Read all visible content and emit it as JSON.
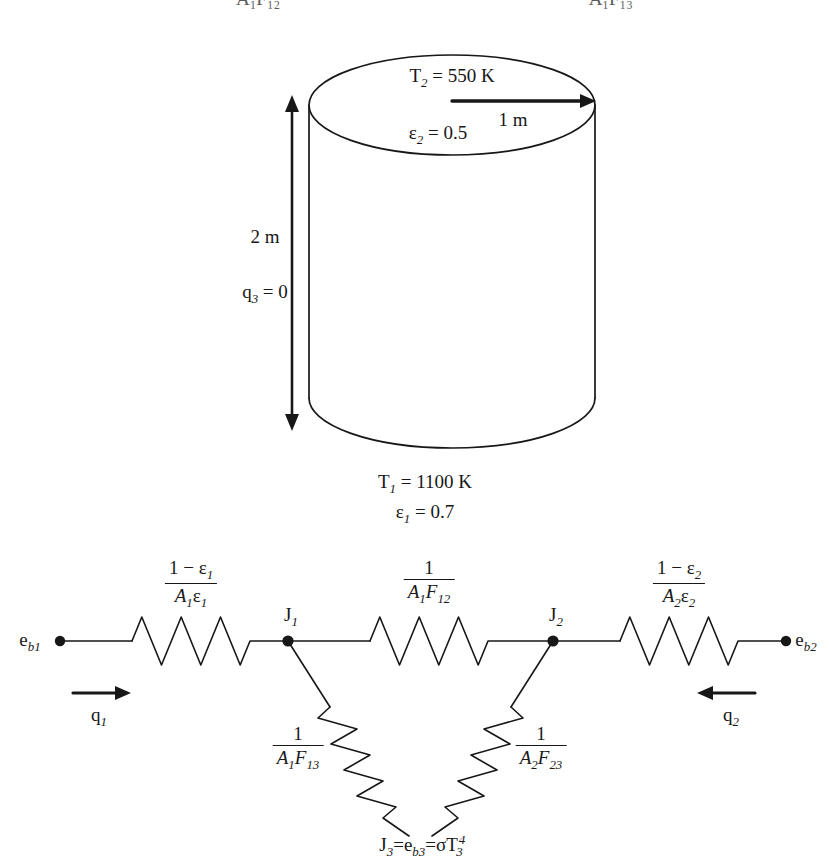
{
  "figure": {
    "top_clipped_row": {
      "left_fragment": "A₁F₁₂",
      "right_fragment": "A₁F₁₃",
      "right_fragment_2": "A₂F₂₃"
    },
    "cylinder": {
      "top_surface": {
        "temperature_label": "T",
        "temperature_sub": "2",
        "temperature_value": "= 550 K",
        "emissivity_label": "ε",
        "emissivity_sub": "2",
        "emissivity_value": "= 0.5"
      },
      "radius_label": "1 m",
      "height_label": "2 m",
      "side_flux_label": "q",
      "side_flux_sub": "3",
      "side_flux_value": "= 0",
      "bottom_surface": {
        "temperature_label": "T",
        "temperature_sub": "1",
        "temperature_value": "= 1100 K",
        "emissivity_label": "ε",
        "emissivity_sub": "1",
        "emissivity_value": "= 0.7"
      }
    },
    "network": {
      "terminals": [
        {
          "name": "e_b1",
          "base": "e",
          "sub": "b1",
          "x": 60
        },
        {
          "name": "e_b2",
          "base": "e",
          "sub": "b2",
          "x": 785
        }
      ],
      "nodes": [
        {
          "name": "J_1",
          "base": "J",
          "sub": "1",
          "x": 288
        },
        {
          "name": "J_2",
          "base": "J",
          "sub": "2",
          "x": 553
        }
      ],
      "bottom_node": {
        "text_j": "J",
        "text_j_sub": "3",
        "eq1": "=",
        "text_e": "e",
        "text_e_sub": "b3",
        "eq2": "=",
        "sigma": "σ",
        "text_t": "T",
        "text_t_sub": "3",
        "text_t_sup": "4"
      },
      "resistors": [
        {
          "id": "surface-1",
          "numerator": "1 − ε₁",
          "denominator": "A₁ε₁",
          "num_plain": "1 − ε",
          "num_sub": "1",
          "den_a": "A",
          "den_a_sub": "1",
          "den_e": "ε",
          "den_e_sub": "1"
        },
        {
          "id": "space-12",
          "numerator": "1",
          "denominator": "A₁F₁₂",
          "den_a": "A",
          "den_a_sub": "1",
          "den_f": "F",
          "den_f_sub": "12"
        },
        {
          "id": "surface-2",
          "numerator": "1 − ε₂",
          "denominator": "A₂ε₂",
          "num_plain": "1 − ε",
          "num_sub": "2",
          "den_a": "A",
          "den_a_sub": "2",
          "den_e": "ε",
          "den_e_sub": "2"
        },
        {
          "id": "space-13",
          "numerator": "1",
          "denominator": "A₁F₁₃",
          "den_a": "A",
          "den_a_sub": "1",
          "den_f": "F",
          "den_f_sub": "13"
        },
        {
          "id": "space-23",
          "numerator": "1",
          "denominator": "A₂F₂₃",
          "den_a": "A",
          "den_a_sub": "2",
          "den_f": "F",
          "den_f_sub": "23"
        }
      ],
      "flux_arrows": [
        {
          "id": "q1",
          "base": "q",
          "sub": "1",
          "direction": "right"
        },
        {
          "id": "q2",
          "base": "q",
          "sub": "2",
          "direction": "left"
        }
      ]
    },
    "colors": {
      "ink": "#171717",
      "background": "#ffffff"
    }
  }
}
